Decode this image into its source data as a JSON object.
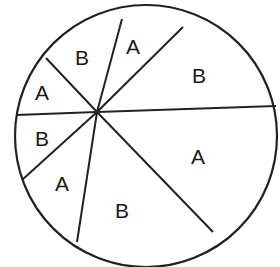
{
  "diagram": {
    "type": "divided-circle",
    "circle": {
      "cx": 146,
      "cy": 136,
      "r": 131
    },
    "hub": {
      "x": 97,
      "y": 112
    },
    "stroke_color": "#222222",
    "background": "#ffffff",
    "spokes": [
      {
        "x": 122,
        "y": 19
      },
      {
        "x": 183,
        "y": 27
      },
      {
        "x": 276,
        "y": 106
      },
      {
        "x": 213,
        "y": 232
      },
      {
        "x": 77,
        "y": 242
      },
      {
        "x": 22,
        "y": 180
      },
      {
        "x": 16,
        "y": 115
      },
      {
        "x": 46,
        "y": 58
      }
    ],
    "sectors": [
      {
        "label": "B",
        "x": 82,
        "y": 57
      },
      {
        "label": "A",
        "x": 133,
        "y": 46
      },
      {
        "label": "B",
        "x": 199,
        "y": 75
      },
      {
        "label": "A",
        "x": 42,
        "y": 92
      },
      {
        "label": "B",
        "x": 42,
        "y": 138
      },
      {
        "label": "A",
        "x": 198,
        "y": 156
      },
      {
        "label": "A",
        "x": 62,
        "y": 183
      },
      {
        "label": "B",
        "x": 122,
        "y": 210
      }
    ]
  }
}
